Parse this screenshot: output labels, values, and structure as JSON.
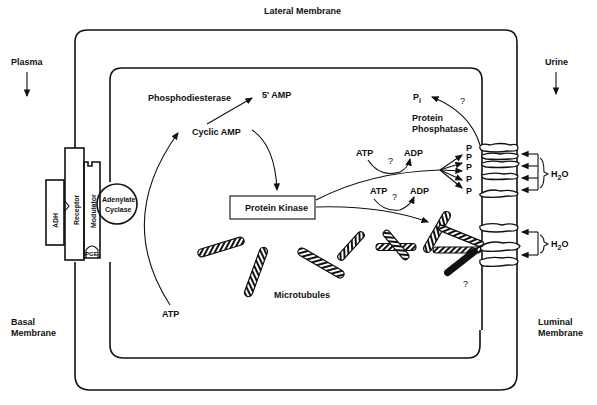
{
  "labels": {
    "lateral_membrane": "Lateral Membrane",
    "plasma": "Plasma",
    "urine": "Urine",
    "basal_membrane_1": "Basal",
    "basal_membrane_2": "Membrane",
    "luminal_membrane_1": "Luminal",
    "luminal_membrane_2": "Membrane",
    "phosphodiesterase": "Phosphodiesterase",
    "amp5": "5' AMP",
    "cyclic_amp": "Cyclic AMP",
    "adh": "ADH",
    "receptor": "Receptor",
    "modulator": "Modulator",
    "pge": "PGE",
    "pge_sub": "1",
    "adenylate_1": "Adenylate",
    "adenylate_2": "Cyclase",
    "protein_kinase": "Protein Kinase",
    "atp_bottom": "ATP",
    "microtubules": "Microtubules",
    "pi": "P",
    "pi_sub": "i",
    "question": "?",
    "protein_phosphatase_1": "Protein",
    "protein_phosphatase_2": "Phosphatase",
    "atp": "ATP",
    "adp": "ADP",
    "p": "P",
    "h2o_h": "H",
    "h2o_sub": "2",
    "h2o_o": "O"
  },
  "colors": {
    "ink": "#111111",
    "background": "#ffffff"
  }
}
